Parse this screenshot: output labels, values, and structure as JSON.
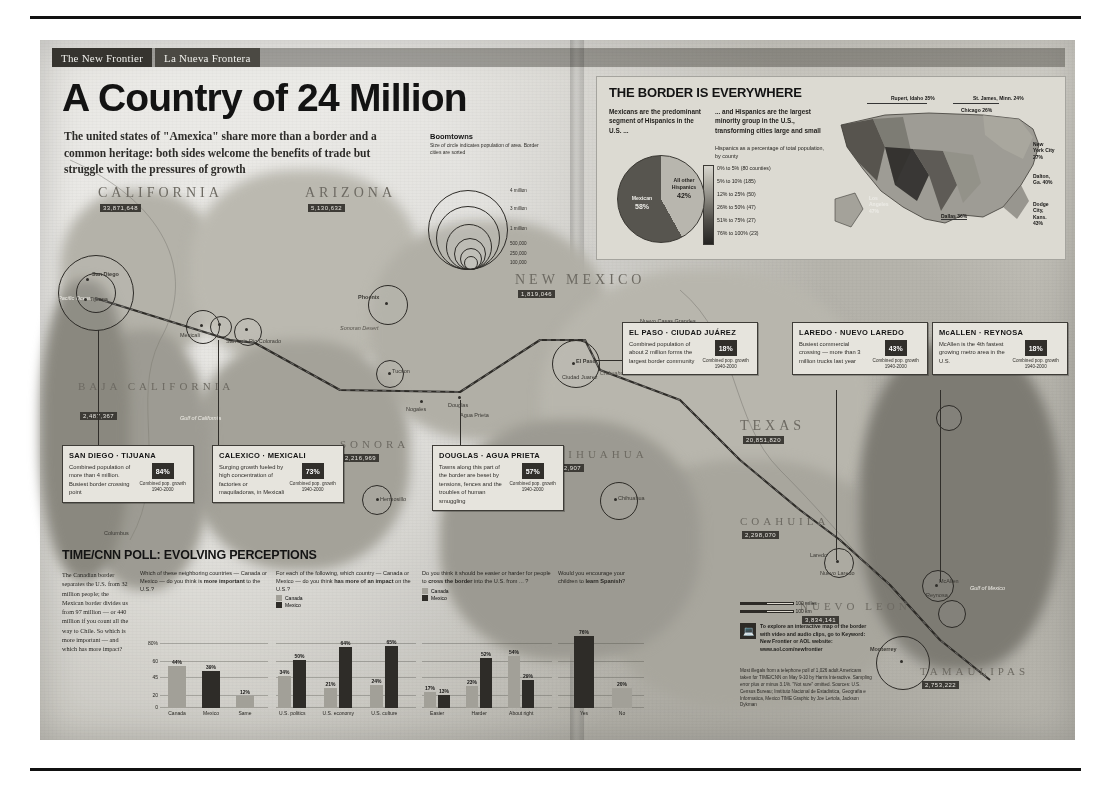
{
  "masthead": {
    "left": "The New Frontier",
    "right": "La Nueva Frontera"
  },
  "headline": "A Country of 24 Million",
  "deck": "The united states of \"Amexica\" share more than a border and a common heritage: both sides welcome the benefits of trade but struggle with the pressures of growth",
  "boomtowns": {
    "title": "Boomtowns",
    "subtitle": "Size of circle indicates population of area. Border cities are sorted",
    "scale": [
      "4 million",
      "3 million",
      "1 million",
      "500,000",
      "250,000",
      "100,000"
    ]
  },
  "map": {
    "states": [
      {
        "name": "CALIFORNIA",
        "tag": "33,871,648"
      },
      {
        "name": "ARIZONA",
        "tag": "5,130,632"
      },
      {
        "name": "NEW MEXICO",
        "tag": "1,819,046"
      },
      {
        "name": "TEXAS",
        "tag": "20,851,820"
      },
      {
        "name": "BAJA CALIFORNIA",
        "tag": "2,487,367"
      },
      {
        "name": "SONORA",
        "tag": "2,216,969"
      },
      {
        "name": "CHIHUAHUA",
        "tag": "3,052,907"
      },
      {
        "name": "COAHUILA",
        "tag": "2,298,070"
      },
      {
        "name": "NUEVO LEON",
        "tag": "3,834,141"
      },
      {
        "name": "TAMAULIPAS",
        "tag": "2,753,222"
      }
    ],
    "cities": [
      "San Diego",
      "Tijuana",
      "Mexicali",
      "Calexico",
      "Yuma",
      "San Luis Rio Colorado",
      "Phoenix",
      "Tucson",
      "Nogales",
      "Douglas",
      "Agua Prieta",
      "Hermosillo",
      "Las Cruces",
      "El Paso",
      "Ciudad Juarez",
      "Chihuahua",
      "Del Rio",
      "Eagle Pass",
      "Piedras Negras",
      "Laredo",
      "Nuevo Laredo",
      "McAllen",
      "Reynosa",
      "Brownsville",
      "Matamoros",
      "Monterrey",
      "Saltillo",
      "Nuevo Casas Grandes",
      "Columbus",
      "Palomas"
    ],
    "labels": {
      "sonoran": "Sonoran Desert",
      "chihuahuan": "Chihuahuan Desert",
      "pacific": "Pacific Ocean",
      "gulfcal": "Gulf of California",
      "gulfmex": "Gulf of Mexico",
      "riogrande": "Rio Grande"
    },
    "scale": {
      "miles": "100 miles",
      "km": "100 km"
    }
  },
  "callouts": [
    {
      "id": "san-diego-tijuana",
      "title": "SAN DIEGO · TIJUANA",
      "body": "Combined population of more than 4 million. Busiest border crossing point",
      "pct": "84%",
      "caption": "Combined pop. growth 1940-2000"
    },
    {
      "id": "calexico-mexicali",
      "title": "CALEXICO · MEXICALI",
      "body": "Surging growth fueled by high concentration of factories or maquiladoras, in Mexicali",
      "pct": "73%",
      "caption": "Combined pop. growth 1940-2000"
    },
    {
      "id": "douglas-agua-prieta",
      "title": "DOUGLAS · AGUA PRIETA",
      "body": "Towns along this part of the border are beset by tensions, fences and the troubles of human smuggling",
      "pct": "57%",
      "caption": "Combined pop. growth 1940-2000"
    },
    {
      "id": "el-paso-ciudad-juarez",
      "title": "EL PASO · CIUDAD JUÁREZ",
      "body": "Combined population of about 2 million forms the largest border community",
      "pct": "18%",
      "caption": "Combined pop. growth 1940-2000"
    },
    {
      "id": "laredo-nuevo-laredo",
      "title": "LAREDO · NUEVO LAREDO",
      "body": "Busiest commercial crossing — more than 3 million trucks last year",
      "pct": "43%",
      "caption": "Combined pop. growth 1940-2000"
    },
    {
      "id": "mcallen-reynosa",
      "title": "McALLEN · REYNOSA",
      "body": "McAllen is the 4th fastest growing metro area in the U.S.",
      "pct": "18%",
      "caption": "Combined pop. growth 1940-2000"
    }
  ],
  "border_everywhere": {
    "title": "THE BORDER IS EVERYWHERE",
    "col1": "Mexicans are the predominant segment of Hispanics in the U.S. ...",
    "col2": "... and Hispanics are the largest minority group in the U.S., transforming cities large and small",
    "legend_title": "Hispanics as a percentage of total population, by county",
    "legend": [
      {
        "range": "0% to 5%",
        "count": "(80 counties)"
      },
      {
        "range": "5% to 10%",
        "count": "(185)"
      },
      {
        "range": "12% to 25%",
        "count": "(50)"
      },
      {
        "range": "26% to 50%",
        "count": "(47)"
      },
      {
        "range": "51% to 75%",
        "count": "(27)"
      },
      {
        "range": "76% to 100%",
        "count": "(23)"
      }
    ],
    "pie": {
      "type": "pie",
      "title": "Hispanic origin in the U.S.",
      "slices": [
        {
          "label": "All other Hispanics",
          "value": 42
        },
        {
          "label": "Mexican",
          "value": 58
        }
      ]
    },
    "us_map_labels": [
      {
        "name": "Rupert, Idaho",
        "pct": "35%"
      },
      {
        "name": "St. James, Minn.",
        "pct": "24%"
      },
      {
        "name": "Chicago",
        "pct": "26%"
      },
      {
        "name": "New York City",
        "pct": "27%"
      },
      {
        "name": "Dalton, Ga.",
        "pct": "40%"
      },
      {
        "name": "Dodge City, Kans.",
        "pct": "43%"
      },
      {
        "name": "Dallas",
        "pct": "36%"
      },
      {
        "name": "Los Angeles",
        "pct": "47%"
      }
    ]
  },
  "poll": {
    "title": "TIME/CNN POLL: EVOLVING PERCEPTIONS",
    "intro": "The Canadian border separates the U.S. from 32 million people; the Mexican border divides us from 97 million — or 440 million if you count all the way to Chile. So which is more important — and which has more impact?",
    "key": {
      "canada": "Canada",
      "mexico": "Mexico"
    },
    "axis": {
      "top": "80%",
      "ticks": [
        "80%",
        "60",
        "45",
        "20",
        "0"
      ]
    },
    "charts": [
      {
        "type": "bar",
        "question_plain": "Which of these neighboring countries — Canada or Mexico — do you think is ",
        "question_bold": "more important",
        "question_tail": " to the U.S.?",
        "categories": [
          "Canada",
          "Mexico",
          "Same"
        ],
        "values": [
          44,
          39,
          12
        ],
        "labels": [
          "44%",
          "39%",
          "12%"
        ],
        "colors": [
          "#a3a199",
          "#2c2a26",
          "#a3a199"
        ],
        "ylim": [
          0,
          80
        ]
      },
      {
        "type": "bar",
        "question_plain": "For each of the following, which country — Canada or Mexico — do you think ",
        "question_bold": "has more of an impact",
        "question_tail": " on the U.S.?",
        "categories": [
          "U.S. politics",
          "U.S. economy",
          "U.S. culture"
        ],
        "series": [
          {
            "name": "Canada",
            "values": [
              34,
              21,
              24
            ],
            "labels": [
              "34%",
              "21%",
              "24%"
            ]
          },
          {
            "name": "Mexico",
            "values": [
              50,
              64,
              65
            ],
            "labels": [
              "50%",
              "64%",
              "65%"
            ]
          }
        ],
        "ylim": [
          0,
          80
        ]
      },
      {
        "type": "bar",
        "question_plain": "Do you think it should be easier or harder for people to ",
        "question_bold": "cross the border",
        "question_tail": " into the U.S. from ... ?",
        "categories": [
          "Easier",
          "Harder",
          "About right"
        ],
        "series": [
          {
            "name": "Canada",
            "values": [
              17,
              23,
              54
            ],
            "labels": [
              "17%",
              "23%",
              "54%"
            ]
          },
          {
            "name": "Mexico",
            "values": [
              13,
              52,
              29
            ],
            "labels": [
              "13%",
              "52%",
              "29%"
            ]
          }
        ],
        "ylim": [
          0,
          80
        ]
      },
      {
        "type": "bar",
        "question_plain": "Would you encourage your children to ",
        "question_bold": "learn Spanish",
        "question_tail": "?",
        "categories": [
          "Yes",
          "No"
        ],
        "values": [
          76,
          20
        ],
        "labels": [
          "76%",
          "20%"
        ],
        "colors": [
          "#2c2a26",
          "#a3a199"
        ],
        "ylim": [
          0,
          80
        ]
      }
    ]
  },
  "interactive_note": "To explore an interactive map of the border with video and audio clips, go to Keyword: New Frontier or AOL website: www.aol.com/newfrontier",
  "sources": "Most illegals from a telephone poll of 1,026 adult Americans taken for TIME/CNN on May 9-10 by Harris Interactive. Sampling error plus or minus 3.1%. \"Not sure\" omitted.\n\nSources: U.S. Census Bureau; Instituto Nacional de Estadistica, Geografia e Informatica, Mexico\n\nTIME Graphic by Joe Lertola, Jackson Dykman",
  "colors": {
    "canada": "#a3a199",
    "mexico": "#2c2a26",
    "ink": "#1c1b18",
    "paper": "#d6d4cc"
  }
}
